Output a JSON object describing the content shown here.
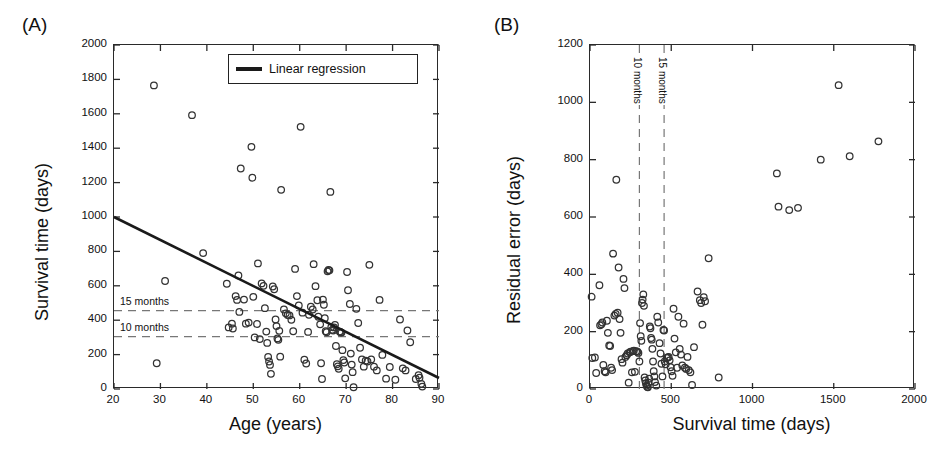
{
  "figure": {
    "background": "#ffffff",
    "marker_color": "#333333",
    "line_color": "#1a1a1a",
    "dash_color": "#777777"
  },
  "panels": {
    "a": {
      "label": "(A)",
      "legend": {
        "swatch_name": "linear-regression-swatch",
        "text": "Linear regression"
      },
      "hline_labels": [
        {
          "text": "15 months",
          "value": 456
        },
        {
          "text": "10 months",
          "value": 304
        }
      ]
    },
    "b": {
      "label": "(B)",
      "vline_labels": [
        {
          "text": "10 months",
          "value": 304
        },
        {
          "text": "15 months",
          "value": 456
        }
      ]
    }
  },
  "chart_data": [
    {
      "panel": "A",
      "type": "scatter",
      "title": "",
      "xlabel": "Age (years)",
      "ylabel": "Survival time (days)",
      "xlim": [
        20,
        90
      ],
      "ylim": [
        0,
        2000
      ],
      "xticks": [
        20,
        30,
        40,
        50,
        60,
        70,
        80,
        90
      ],
      "yticks": [
        0,
        200,
        400,
        600,
        800,
        1000,
        1200,
        1400,
        1600,
        1800,
        2000
      ],
      "grid": false,
      "legend": [
        "Linear regression"
      ],
      "legend_position": "top-right",
      "annotations": [
        {
          "type": "hline",
          "y": 456,
          "label": "15 months",
          "style": "dashed"
        },
        {
          "type": "hline",
          "y": 304,
          "label": "10 months",
          "style": "dashed"
        }
      ],
      "series": [
        {
          "name": "Patients",
          "marker": "open-circle",
          "points": [
            [
              28.6,
              1765
            ],
            [
              29.2,
              150
            ],
            [
              31.0,
              628
            ],
            [
              36.8,
              1592
            ],
            [
              39.2,
              790
            ],
            [
              44.3,
              612
            ],
            [
              44.7,
              358
            ],
            [
              45.4,
              380
            ],
            [
              45.6,
              352
            ],
            [
              46.2,
              540
            ],
            [
              46.5,
              518
            ],
            [
              46.8,
              660
            ],
            [
              47.0,
              448
            ],
            [
              47.3,
              1282
            ],
            [
              48.0,
              520
            ],
            [
              48.4,
              380
            ],
            [
              49.0,
              386
            ],
            [
              49.6,
              1408
            ],
            [
              49.8,
              1228
            ],
            [
              50.0,
              536
            ],
            [
              50.3,
              300
            ],
            [
              50.8,
              378
            ],
            [
              51.0,
              730
            ],
            [
              51.4,
              290
            ],
            [
              51.8,
              614
            ],
            [
              52.2,
              600
            ],
            [
              52.5,
              470
            ],
            [
              52.8,
              334
            ],
            [
              53.0,
              268
            ],
            [
              53.2,
              186
            ],
            [
              53.4,
              160
            ],
            [
              53.6,
              140
            ],
            [
              53.8,
              88
            ],
            [
              54.2,
              596
            ],
            [
              54.5,
              580
            ],
            [
              54.8,
              404
            ],
            [
              55.0,
              366
            ],
            [
              55.2,
              294
            ],
            [
              55.4,
              286
            ],
            [
              55.6,
              338
            ],
            [
              55.8,
              188
            ],
            [
              56.0,
              1158
            ],
            [
              56.6,
              462
            ],
            [
              57.0,
              440
            ],
            [
              57.4,
              430
            ],
            [
              57.8,
              428
            ],
            [
              58.2,
              402
            ],
            [
              58.6,
              336
            ],
            [
              59.0,
              698
            ],
            [
              59.4,
              540
            ],
            [
              59.8,
              486
            ],
            [
              60.2,
              1524
            ],
            [
              60.6,
              444
            ],
            [
              61.0,
              170
            ],
            [
              61.4,
              148
            ],
            [
              61.8,
              332
            ],
            [
              62.0,
              432
            ],
            [
              62.4,
              478
            ],
            [
              62.8,
              462
            ],
            [
              63.0,
              726
            ],
            [
              63.4,
              598
            ],
            [
              63.8,
              516
            ],
            [
              64.0,
              420
            ],
            [
              64.4,
              376
            ],
            [
              64.6,
              150
            ],
            [
              64.8,
              58
            ],
            [
              65.0,
              520
            ],
            [
              65.2,
              490
            ],
            [
              65.4,
              412
            ],
            [
              65.6,
              336
            ],
            [
              65.8,
              330
            ],
            [
              66.0,
              684
            ],
            [
              66.2,
              692
            ],
            [
              66.4,
              690
            ],
            [
              66.6,
              1146
            ],
            [
              66.8,
              360
            ],
            [
              67.0,
              344
            ],
            [
              67.2,
              340
            ],
            [
              67.4,
              358
            ],
            [
              67.6,
              372
            ],
            [
              67.8,
              250
            ],
            [
              68.0,
              144
            ],
            [
              68.2,
              132
            ],
            [
              68.4,
              118
            ],
            [
              68.6,
              334
            ],
            [
              68.8,
              330
            ],
            [
              69.0,
              328
            ],
            [
              69.2,
              226
            ],
            [
              69.4,
              168
            ],
            [
              69.6,
              154
            ],
            [
              69.8,
              62
            ],
            [
              70.2,
              680
            ],
            [
              70.4,
              574
            ],
            [
              70.8,
              494
            ],
            [
              71.0,
              206
            ],
            [
              71.2,
              142
            ],
            [
              71.4,
              98
            ],
            [
              71.6,
              10
            ],
            [
              72.2,
              466
            ],
            [
              72.6,
              384
            ],
            [
              73.0,
              240
            ],
            [
              73.4,
              172
            ],
            [
              73.8,
              130
            ],
            [
              74.2,
              164
            ],
            [
              74.6,
              160
            ],
            [
              75.0,
              722
            ],
            [
              75.4,
              172
            ],
            [
              76.0,
              130
            ],
            [
              76.6,
              108
            ],
            [
              77.2,
              518
            ],
            [
              77.8,
              198
            ],
            [
              78.6,
              60
            ],
            [
              79.4,
              128
            ],
            [
              80.6,
              54
            ],
            [
              81.6,
              404
            ],
            [
              82.2,
              120
            ],
            [
              82.8,
              108
            ],
            [
              83.2,
              340
            ],
            [
              83.8,
              272
            ],
            [
              85.0,
              58
            ],
            [
              85.6,
              80
            ],
            [
              85.8,
              66
            ],
            [
              86.2,
              30
            ],
            [
              86.4,
              14
            ]
          ]
        }
      ],
      "fit_line": {
        "name": "Linear regression",
        "x_start": 20,
        "y_start": 1000,
        "x_end": 90,
        "y_end": 64
      }
    },
    {
      "panel": "B",
      "type": "scatter",
      "title": "",
      "xlabel": "Survival time (days)",
      "ylabel": "Residual error (days)",
      "xlim": [
        0,
        2000
      ],
      "ylim": [
        0,
        1200
      ],
      "xticks": [
        0,
        500,
        1000,
        1500,
        2000
      ],
      "yticks": [
        0,
        200,
        400,
        600,
        800,
        1000,
        1200
      ],
      "grid": false,
      "legend": [],
      "annotations": [
        {
          "type": "vline",
          "x": 304,
          "label": "10 months",
          "style": "dashed"
        },
        {
          "type": "vline",
          "x": 456,
          "label": "15 months",
          "style": "dashed"
        }
      ],
      "series": [
        {
          "name": "Patients",
          "marker": "open-circle",
          "points": [
            [
              10,
              322
            ],
            [
              14,
              108
            ],
            [
              30,
              110
            ],
            [
              38,
              56
            ],
            [
              58,
              362
            ],
            [
              62,
              222
            ],
            [
              70,
              226
            ],
            [
              76,
              232
            ],
            [
              82,
              84
            ],
            [
              90,
              62
            ],
            [
              96,
              58
            ],
            [
              104,
              238
            ],
            [
              110,
              196
            ],
            [
              118,
              152
            ],
            [
              124,
              150
            ],
            [
              130,
              74
            ],
            [
              136,
              66
            ],
            [
              142,
              472
            ],
            [
              150,
              256
            ],
            [
              158,
              262
            ],
            [
              162,
              730
            ],
            [
              170,
              266
            ],
            [
              176,
              424
            ],
            [
              182,
              244
            ],
            [
              188,
              196
            ],
            [
              194,
              104
            ],
            [
              200,
              92
            ],
            [
              206,
              384
            ],
            [
              212,
              352
            ],
            [
              218,
              112
            ],
            [
              226,
              118
            ],
            [
              232,
              124
            ],
            [
              238,
              22
            ],
            [
              244,
              128
            ],
            [
              250,
              130
            ],
            [
              258,
              58
            ],
            [
              264,
              132
            ],
            [
              270,
              134
            ],
            [
              276,
              60
            ],
            [
              284,
              132
            ],
            [
              292,
              130
            ],
            [
              298,
              126
            ],
            [
              304,
              96
            ],
            [
              308,
              230
            ],
            [
              312,
              184
            ],
            [
              316,
              168
            ],
            [
              320,
              300
            ],
            [
              324,
              312
            ],
            [
              328,
              330
            ],
            [
              332,
              290
            ],
            [
              336,
              40
            ],
            [
              340,
              30
            ],
            [
              344,
              20
            ],
            [
              348,
              12
            ],
            [
              352,
              8
            ],
            [
              356,
              6
            ],
            [
              360,
              22
            ],
            [
              364,
              36
            ],
            [
              368,
              218
            ],
            [
              372,
              212
            ],
            [
              376,
              178
            ],
            [
              380,
              172
            ],
            [
              384,
              140
            ],
            [
              388,
              96
            ],
            [
              392,
              62
            ],
            [
              396,
              44
            ],
            [
              400,
              24
            ],
            [
              408,
              12
            ],
            [
              414,
              252
            ],
            [
              420,
              232
            ],
            [
              428,
              160
            ],
            [
              434,
              124
            ],
            [
              440,
              88
            ],
            [
              446,
              44
            ],
            [
              452,
              206
            ],
            [
              456,
              204
            ],
            [
              460,
              96
            ],
            [
              466,
              86
            ],
            [
              472,
              108
            ],
            [
              478,
              110
            ],
            [
              484,
              112
            ],
            [
              490,
              100
            ],
            [
              496,
              76
            ],
            [
              502,
              62
            ],
            [
              508,
              46
            ],
            [
              514,
              280
            ],
            [
              520,
              176
            ],
            [
              528,
              128
            ],
            [
              536,
              74
            ],
            [
              544,
              252
            ],
            [
              552,
              140
            ],
            [
              560,
              120
            ],
            [
              568,
              82
            ],
            [
              576,
              228
            ],
            [
              584,
              74
            ],
            [
              592,
              70
            ],
            [
              600,
              112
            ],
            [
              608,
              66
            ],
            [
              618,
              58
            ],
            [
              628,
              14
            ],
            [
              640,
              146
            ],
            [
              662,
              340
            ],
            [
              676,
              310
            ],
            [
              684,
              300
            ],
            [
              692,
              224
            ],
            [
              700,
              320
            ],
            [
              708,
              306
            ],
            [
              730,
              456
            ],
            [
              792,
              40
            ],
            [
              1150,
              752
            ],
            [
              1160,
              636
            ],
            [
              1226,
              624
            ],
            [
              1280,
              632
            ],
            [
              1420,
              800
            ],
            [
              1530,
              1060
            ],
            [
              1598,
              812
            ],
            [
              1775,
              864
            ]
          ]
        }
      ]
    }
  ]
}
